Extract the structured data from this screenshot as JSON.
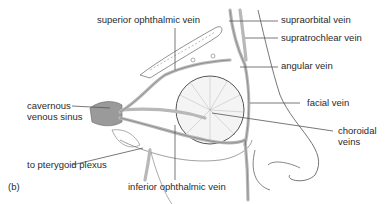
{
  "figure": {
    "panel_label": "(b)",
    "labels": {
      "superior_ophthalmic_vein": "superior ophthalmic vein",
      "supraorbital_vein": "supraorbital vein",
      "supratrochlear_vein": "supratrochlear vein",
      "angular_vein": "angular vein",
      "cavernous_line1": "cavernous",
      "cavernous_line2": "venous sinus",
      "facial_vein": "facial vein",
      "choroidal_line1": "choroidal",
      "choroidal_line2": "veins",
      "pterygoid_plexus": "to pterygoid plexus",
      "inferior_ophthalmic_vein": "inferior ophthalmic vein"
    },
    "colors": {
      "line": "#555555",
      "vessel_fill": "#b8b8b8",
      "sinus_fill": "#9a9a9a",
      "text": "#2a2a2a"
    }
  }
}
